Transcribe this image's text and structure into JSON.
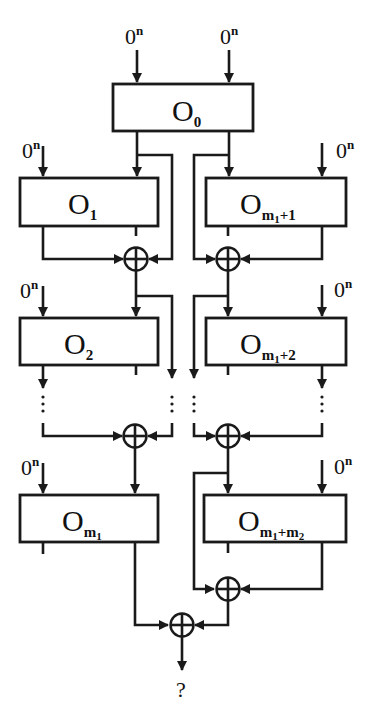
{
  "diagram": {
    "zero_input": {
      "base": "0",
      "sup": "n"
    },
    "blocks": {
      "o0": {
        "base": "O",
        "sub": "0"
      },
      "o1": {
        "base": "O",
        "sub": "1"
      },
      "o2": {
        "base": "O",
        "sub": "2"
      },
      "om1": {
        "base": "O",
        "sub": "m",
        "subsub": "1"
      },
      "om1p1": {
        "base": "O",
        "sub": "m",
        "subsub": "1",
        "tail": "+1"
      },
      "om1p2": {
        "base": "O",
        "sub": "m",
        "subsub": "1",
        "tail": "+2"
      },
      "om1pm2": {
        "base": "O",
        "sub": "m",
        "subsub": "1",
        "tail": "+m",
        "tailsub": "2"
      }
    },
    "ellipsis": "⋮",
    "output_label": "?",
    "colors": {
      "ink": "#1a1a1a",
      "background": "#ffffff"
    }
  }
}
